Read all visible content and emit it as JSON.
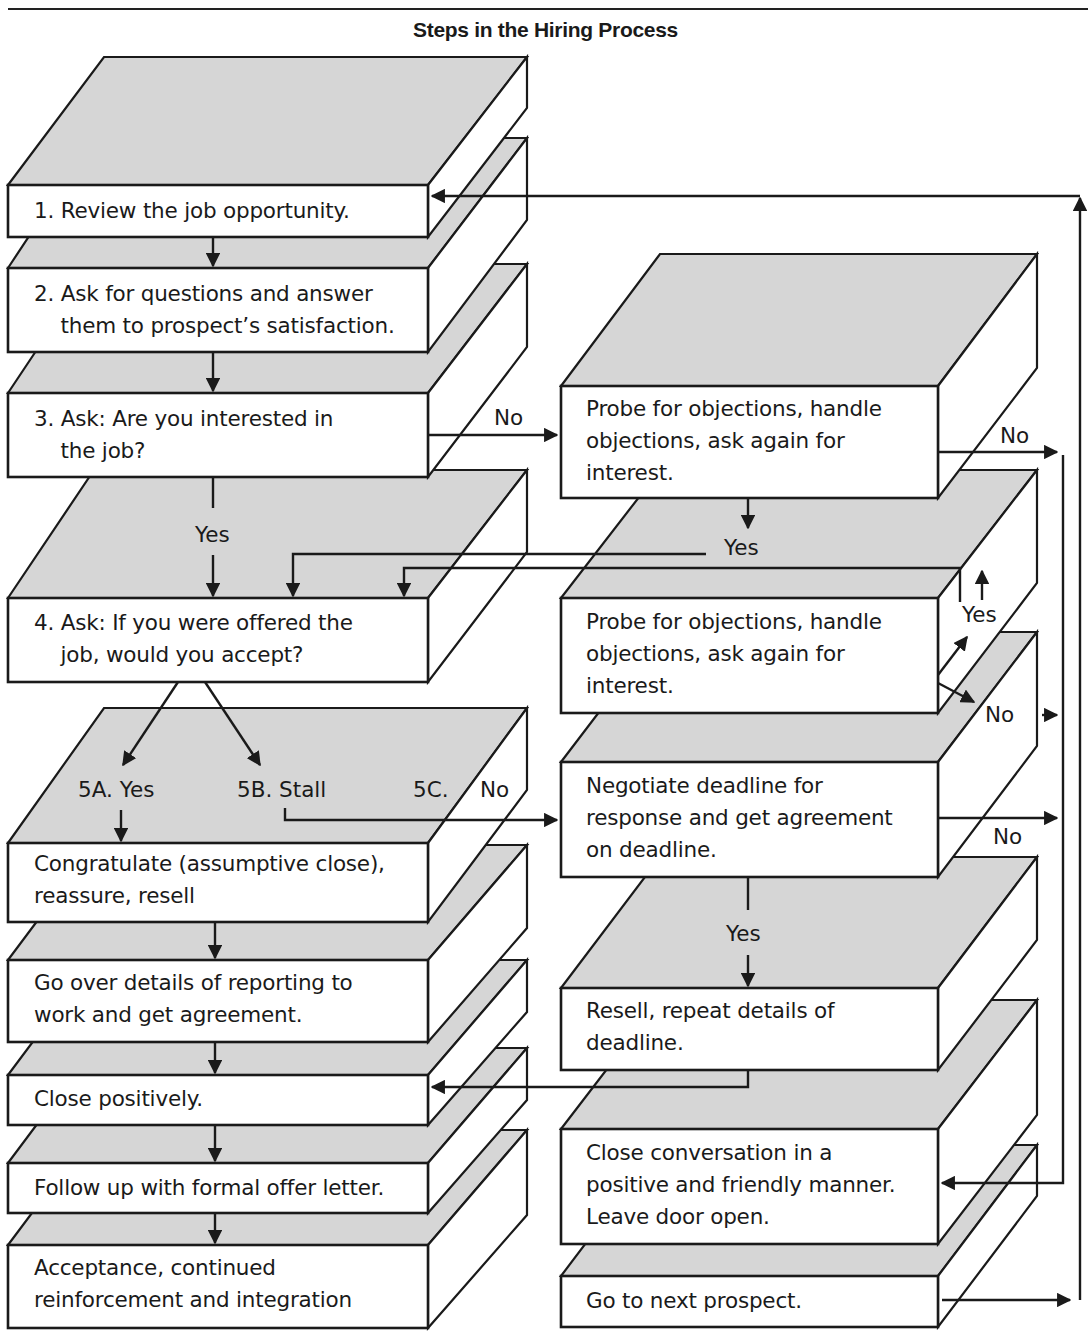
{
  "title": "Steps in the Hiring Process",
  "left_column": [
    {
      "id": "step1",
      "text": "1. Review the job opportunity."
    },
    {
      "id": "step2",
      "text": "2. Ask for questions and answer\n    them to prospect’s satisfaction."
    },
    {
      "id": "step3",
      "text": "3. Ask: Are you interested in\n    the job?"
    },
    {
      "id": "step4",
      "text": "4. Ask: If you were offered the\n    job, would you accept?"
    },
    {
      "id": "step5a",
      "text": "Congratulate (assumptive close),\nreassure, resell"
    },
    {
      "id": "step6",
      "text": "Go over details of reporting to\nwork and get agreement."
    },
    {
      "id": "step7",
      "text": "Close positively."
    },
    {
      "id": "step8",
      "text": "Follow up with formal offer letter."
    },
    {
      "id": "step9",
      "text": "Acceptance, continued\nreinforcement and integration"
    }
  ],
  "right_column": [
    {
      "id": "probe1",
      "text": "Probe for objections, handle\nobjections, ask again for\ninterest."
    },
    {
      "id": "probe2",
      "text": "Probe for objections, handle\nobjections, ask again for\ninterest."
    },
    {
      "id": "negotiate",
      "text": "Negotiate deadline for\nresponse and get agreement\non deadline."
    },
    {
      "id": "resell",
      "text": "Resell, repeat details of\ndeadline."
    },
    {
      "id": "close_conv",
      "text": "Close conversation in a\npositive and friendly manner.\nLeave door open."
    },
    {
      "id": "next",
      "text": "Go to next prospect."
    }
  ],
  "edge_labels": {
    "step3_no": "No",
    "step3_yes": "Yes",
    "probe1_no": "No",
    "probe1_yes": "Yes",
    "probe2_yes": "Yes",
    "probe2_no": "No",
    "opt_5a": "5A. Yes",
    "opt_5b": "5B. Stall",
    "opt_5c": "5C.",
    "opt_5c_no": "No",
    "negotiate_no": "No",
    "negotiate_yes": "Yes"
  }
}
